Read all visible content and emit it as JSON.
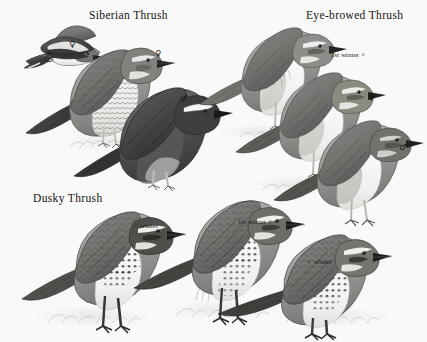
{
  "plate": {
    "kind": "field-guide-illustration-plate",
    "background_color": "#fdfdfd",
    "ink_color": "#15130f",
    "medium": "graphite and grey wash, monochrome"
  },
  "titles": {
    "siberian": "Siberian Thrush",
    "eyebrowed": "Eye-browed Thrush",
    "dusky": "Dusky Thrush"
  },
  "symbols": {
    "female": "♀",
    "male": "♂"
  },
  "labels": {
    "siberian_flight": "♀",
    "siberian_female": "♀",
    "siberian_male": "♂",
    "eyebrowed_first_winter": "1st winter ♀",
    "eyebrowed_female": "♀",
    "eyebrowed_male": "♂",
    "dusky_male_winter": "♂ winter",
    "dusky_first_winter": "1st winter ♀",
    "dusky_female_winter": "♀ winter"
  },
  "figures": [
    {
      "species": "Siberian Thrush",
      "caption": "♀",
      "pose": "in flight, underwing shown, upper left",
      "position": {
        "x": 14,
        "y": 26,
        "w": 78,
        "h": 48
      }
    },
    {
      "species": "Siberian Thrush",
      "caption": "♀",
      "pose": "perched, facing right, scaly buff underparts",
      "position": {
        "x": 58,
        "y": 40,
        "w": 105,
        "h": 110
      }
    },
    {
      "species": "Siberian Thrush",
      "caption": "♂",
      "pose": "perched, facing right, slaty-black with white supercilium",
      "position": {
        "x": 108,
        "y": 80,
        "w": 110,
        "h": 105
      }
    },
    {
      "species": "Eye-browed Thrush",
      "caption": "1st winter ♀",
      "pose": "perched, facing right, pale supercilium",
      "position": {
        "x": 228,
        "y": 30,
        "w": 110,
        "h": 92
      }
    },
    {
      "species": "Eye-browed Thrush",
      "caption": "♀",
      "pose": "perched, facing right",
      "position": {
        "x": 262,
        "y": 72,
        "w": 112,
        "h": 92
      }
    },
    {
      "species": "Eye-browed Thrush",
      "caption": "♂",
      "pose": "perched, facing right, grey head",
      "position": {
        "x": 300,
        "y": 120,
        "w": 115,
        "h": 95
      }
    },
    {
      "species": "Dusky Thrush",
      "caption": "♂ winter",
      "pose": "standing on ground, facing right, dark breast band",
      "position": {
        "x": 18,
        "y": 208,
        "w": 130,
        "h": 120
      }
    },
    {
      "species": "Dusky Thrush",
      "caption": "1st winter ♀",
      "pose": "standing on ground, facing right",
      "position": {
        "x": 140,
        "y": 195,
        "w": 130,
        "h": 125
      }
    },
    {
      "species": "Dusky Thrush",
      "caption": "♀ winter",
      "pose": "standing on ground, facing right",
      "position": {
        "x": 228,
        "y": 235,
        "w": 135,
        "h": 105
      }
    }
  ]
}
